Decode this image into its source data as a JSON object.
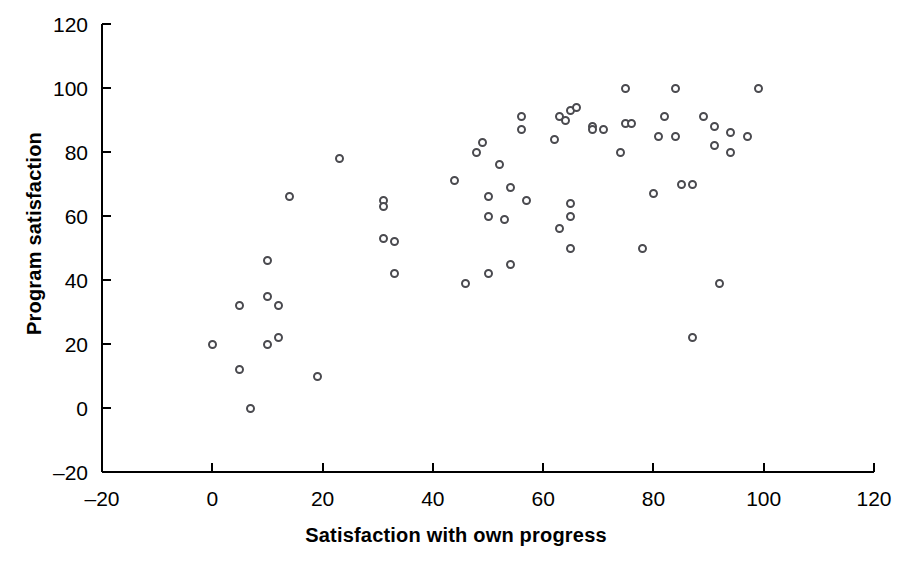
{
  "chart_data": {
    "type": "scatter",
    "title": "",
    "xlabel": "Satisfaction with own progress",
    "ylabel": "Program satisfaction",
    "xlim": [
      -20,
      120
    ],
    "ylim": [
      -20,
      120
    ],
    "xticks": [
      -20,
      0,
      20,
      40,
      60,
      80,
      100,
      120
    ],
    "yticks": [
      -20,
      0,
      20,
      40,
      60,
      80,
      100,
      120
    ],
    "xticklabels": [
      "–20",
      "0",
      "20",
      "40",
      "60",
      "80",
      "100",
      "120"
    ],
    "yticklabels": [
      "–20",
      "0",
      "20",
      "40",
      "60",
      "80",
      "100",
      "120"
    ],
    "grid": false,
    "legend": null,
    "marker": {
      "shape": "circle-open",
      "edge_color": "#4a4a4f",
      "fill_color": "#ffffff",
      "size_px": 9
    },
    "axis_color": "#000000",
    "n_points": 64,
    "points": [
      {
        "x": 0,
        "y": 20
      },
      {
        "x": 5,
        "y": 12
      },
      {
        "x": 5,
        "y": 32
      },
      {
        "x": 7,
        "y": 0
      },
      {
        "x": 10,
        "y": 20
      },
      {
        "x": 10,
        "y": 35
      },
      {
        "x": 10,
        "y": 46
      },
      {
        "x": 12,
        "y": 22
      },
      {
        "x": 12,
        "y": 32
      },
      {
        "x": 14,
        "y": 66
      },
      {
        "x": 19,
        "y": 10
      },
      {
        "x": 23,
        "y": 78
      },
      {
        "x": 31,
        "y": 65
      },
      {
        "x": 31,
        "y": 63
      },
      {
        "x": 31,
        "y": 53
      },
      {
        "x": 33,
        "y": 52
      },
      {
        "x": 33,
        "y": 42
      },
      {
        "x": 44,
        "y": 71
      },
      {
        "x": 46,
        "y": 39
      },
      {
        "x": 48,
        "y": 80
      },
      {
        "x": 49,
        "y": 83
      },
      {
        "x": 50,
        "y": 42
      },
      {
        "x": 50,
        "y": 66
      },
      {
        "x": 50,
        "y": 60
      },
      {
        "x": 52,
        "y": 76
      },
      {
        "x": 53,
        "y": 59
      },
      {
        "x": 54,
        "y": 69
      },
      {
        "x": 54,
        "y": 45
      },
      {
        "x": 56,
        "y": 91
      },
      {
        "x": 56,
        "y": 87
      },
      {
        "x": 57,
        "y": 65
      },
      {
        "x": 62,
        "y": 84
      },
      {
        "x": 63,
        "y": 91
      },
      {
        "x": 63,
        "y": 56
      },
      {
        "x": 64,
        "y": 90
      },
      {
        "x": 65,
        "y": 93
      },
      {
        "x": 65,
        "y": 64
      },
      {
        "x": 65,
        "y": 60
      },
      {
        "x": 65,
        "y": 50
      },
      {
        "x": 66,
        "y": 94
      },
      {
        "x": 69,
        "y": 88
      },
      {
        "x": 69,
        "y": 87
      },
      {
        "x": 71,
        "y": 87
      },
      {
        "x": 74,
        "y": 80
      },
      {
        "x": 75,
        "y": 100
      },
      {
        "x": 75,
        "y": 89
      },
      {
        "x": 76,
        "y": 89
      },
      {
        "x": 78,
        "y": 50
      },
      {
        "x": 80,
        "y": 67
      },
      {
        "x": 81,
        "y": 85
      },
      {
        "x": 82,
        "y": 91
      },
      {
        "x": 84,
        "y": 85
      },
      {
        "x": 84,
        "y": 100
      },
      {
        "x": 85,
        "y": 70
      },
      {
        "x": 87,
        "y": 70
      },
      {
        "x": 87,
        "y": 22
      },
      {
        "x": 89,
        "y": 91
      },
      {
        "x": 91,
        "y": 88
      },
      {
        "x": 91,
        "y": 82
      },
      {
        "x": 92,
        "y": 39
      },
      {
        "x": 94,
        "y": 86
      },
      {
        "x": 94,
        "y": 80
      },
      {
        "x": 97,
        "y": 85
      },
      {
        "x": 99,
        "y": 100
      }
    ]
  }
}
